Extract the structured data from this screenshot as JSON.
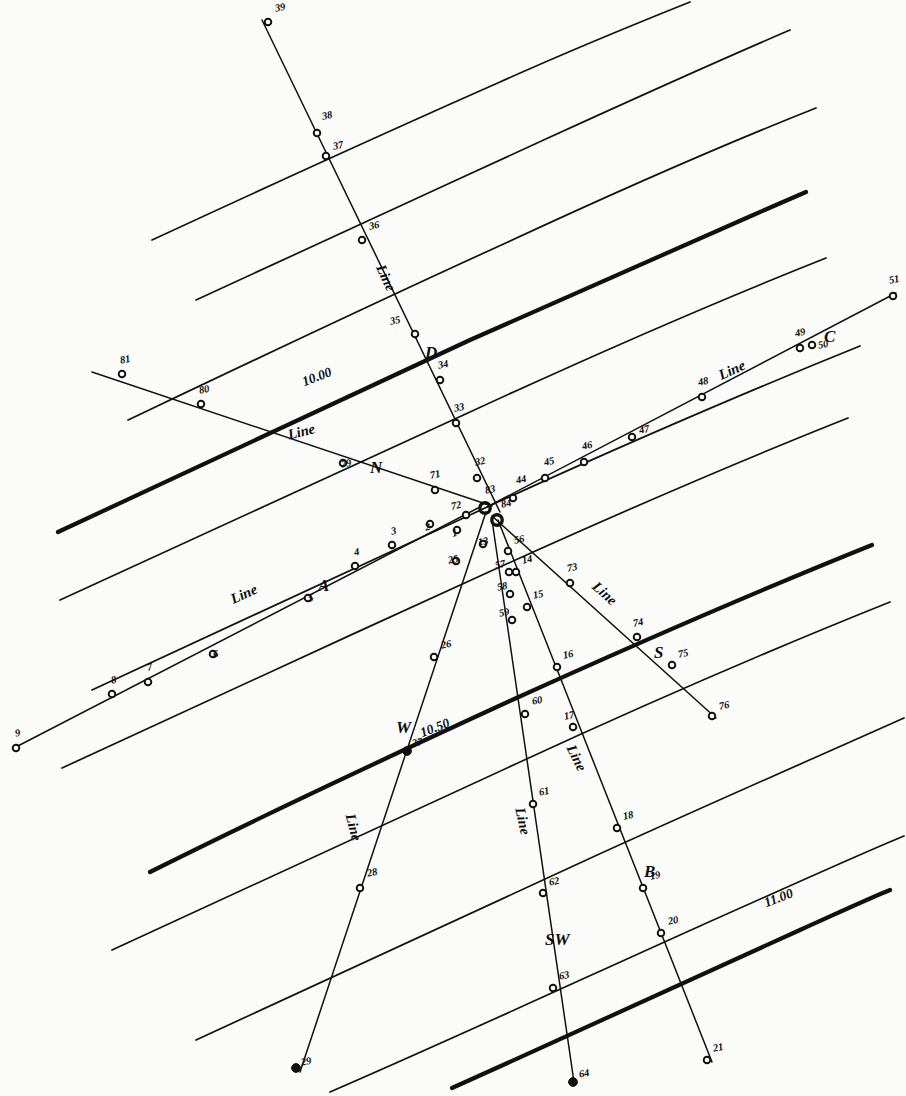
{
  "figure": {
    "kind": "survey-plan",
    "ink": "#101010",
    "paper": "#fbfbf9"
  },
  "chart_data": {
    "type": "scatter",
    "title": "",
    "xlabel": "",
    "ylabel": "",
    "grid": false,
    "legend": null,
    "contours": [
      {
        "label": "10.00",
        "label_x": 300,
        "label_y": 375,
        "label_rot": -21,
        "weight": "heavy",
        "path": "M 58,532 C 190,470 330,405 470,340 C 600,282 700,238 806,192"
      },
      {
        "label": "10.50",
        "label_x": 418,
        "label_y": 726,
        "label_rot": -21,
        "weight": "heavy",
        "path": "M 150,872 C 270,812 390,756 512,700 C 640,642 755,592 872,545"
      },
      {
        "label": "11.00",
        "label_x": 762,
        "label_y": 896,
        "label_rot": -21,
        "weight": "heavy",
        "path": "M 452,1088 C 570,1035 690,980 800,930 C 840,912 870,898 890,890"
      },
      {
        "label": "",
        "weight": "light",
        "path": "M 152,240 C 260,190 380,135 500,82 C 580,46 640,22 690,2"
      },
      {
        "label": "",
        "weight": "light",
        "path": "M 196,300 C 310,248 430,192 548,138 C 640,96 720,60 790,30"
      },
      {
        "label": "",
        "weight": "light",
        "path": "M 128,420 C 250,362 380,300 508,242 C 620,190 720,146 816,108"
      },
      {
        "label": "",
        "weight": "light",
        "path": "M 60,600 C 190,540 330,476 470,412 C 600,352 710,304 826,258"
      },
      {
        "label": "",
        "weight": "light",
        "path": "M 92,690 C 220,630 360,566 498,502 C 630,442 746,392 860,346"
      },
      {
        "label": "",
        "weight": "light",
        "path": "M 62,768 C 195,706 340,640 480,576 C 612,516 732,464 848,418"
      },
      {
        "label": "",
        "weight": "light",
        "path": "M 112,950 C 240,890 380,826 520,762 C 650,702 770,650 890,602"
      },
      {
        "label": "",
        "weight": "light",
        "path": "M 196,1040 C 320,982 450,922 582,862 C 700,808 810,760 904,718"
      },
      {
        "label": "",
        "weight": "light",
        "path": "M 330,1092 C 450,1040 580,980 700,926 C 790,886 860,854 904,836"
      }
    ],
    "lines": [
      {
        "name": "A",
        "label": "Line",
        "label_x": 228,
        "label_y": 592,
        "label_rot": -24,
        "name_x": 318,
        "name_y": 576,
        "path": "M 14,748 L 478,508",
        "weight": "light",
        "points": [
          "9",
          "8",
          "7",
          "6",
          "5",
          "4",
          "3",
          "2",
          "1",
          "72"
        ]
      },
      {
        "name": "N",
        "label": "Line",
        "label_x": 286,
        "label_y": 427,
        "label_rot": -14,
        "name_x": 370,
        "name_y": 458,
        "path": "M 92,372 L 492,506",
        "weight": "light",
        "points": [
          "81",
          "80",
          "79",
          "71"
        ]
      },
      {
        "name": "D",
        "label": "Line",
        "label_x": 388,
        "label_y": 262,
        "label_rot": 66,
        "name_x": 425,
        "name_y": 343,
        "path": "M 262,20 L 500,512",
        "weight": "light",
        "points": [
          "39",
          "38",
          "37",
          "36",
          "35",
          "34",
          "33",
          "32"
        ]
      },
      {
        "name": "C",
        "label": "Line",
        "label_x": 716,
        "label_y": 368,
        "label_rot": -24,
        "name_x": 824,
        "name_y": 327,
        "path": "M 487,507 L 896,293",
        "weight": "light",
        "points": [
          "44",
          "45",
          "46",
          "47",
          "48",
          "49",
          "50",
          "51"
        ]
      },
      {
        "name": "S",
        "label": "Line",
        "label_x": 600,
        "label_y": 578,
        "label_rot": 42,
        "name_x": 654,
        "name_y": 643,
        "path": "M 492,516 L 716,718",
        "weight": "light",
        "points": [
          "73",
          "74",
          "75",
          "76"
        ]
      },
      {
        "name": "B",
        "label": "Line",
        "label_x": 578,
        "label_y": 742,
        "label_rot": 64,
        "name_x": 644,
        "name_y": 862,
        "path": "M 498,520 L 712,1062",
        "weight": "light",
        "points": [
          "56",
          "14",
          "15",
          "16",
          "17",
          "18",
          "19",
          "20",
          "21"
        ]
      },
      {
        "name": "SW",
        "label": "Line",
        "label_x": 528,
        "label_y": 806,
        "label_rot": 78,
        "name_x": 545,
        "name_y": 930,
        "path": "M 492,520 L 574,1082",
        "weight": "light",
        "points": [
          "13",
          "57",
          "58",
          "59",
          "60",
          "61",
          "62",
          "63",
          "64"
        ]
      },
      {
        "name": "W",
        "label": "Line",
        "label_x": 358,
        "label_y": 812,
        "label_rot": 75,
        "name_x": 396,
        "name_y": 718,
        "path": "M 486,512 L 300,1072",
        "weight": "light",
        "points": [
          "25",
          "26",
          "27",
          "28",
          "29"
        ]
      }
    ],
    "stations": [
      {
        "id": "1",
        "x": 457,
        "y": 530,
        "lx": 451,
        "ly": 539,
        "marker": "open"
      },
      {
        "id": "2",
        "x": 430,
        "y": 524,
        "lx": 424,
        "ly": 533,
        "marker": "open"
      },
      {
        "id": "3",
        "x": 392,
        "y": 545,
        "lx": 390,
        "ly": 537,
        "marker": "open"
      },
      {
        "id": "4",
        "x": 355,
        "y": 566,
        "lx": 353,
        "ly": 558,
        "marker": "open"
      },
      {
        "id": "5",
        "x": 308,
        "y": 598,
        "lx": 307,
        "ly": 604,
        "marker": "open"
      },
      {
        "id": "6",
        "x": 213,
        "y": 654,
        "lx": 212,
        "ly": 660,
        "marker": "open"
      },
      {
        "id": "7",
        "x": 148,
        "y": 682,
        "lx": 146,
        "ly": 673,
        "marker": "open"
      },
      {
        "id": "8",
        "x": 112,
        "y": 694,
        "lx": 110,
        "ly": 686,
        "marker": "open"
      },
      {
        "id": "9",
        "x": 16,
        "y": 748,
        "lx": 14,
        "ly": 739,
        "marker": "open"
      },
      {
        "id": "13",
        "x": 483,
        "y": 544,
        "lx": 477,
        "ly": 548,
        "marker": "open"
      },
      {
        "id": "14",
        "x": 516,
        "y": 572,
        "lx": 521,
        "ly": 566,
        "marker": "open"
      },
      {
        "id": "15",
        "x": 527,
        "y": 607,
        "lx": 532,
        "ly": 601,
        "marker": "open"
      },
      {
        "id": "16",
        "x": 557,
        "y": 667,
        "lx": 562,
        "ly": 661,
        "marker": "open"
      },
      {
        "id": "17",
        "x": 573,
        "y": 727,
        "lx": 563,
        "ly": 722,
        "marker": "open"
      },
      {
        "id": "18",
        "x": 617,
        "y": 828,
        "lx": 622,
        "ly": 822,
        "marker": "open"
      },
      {
        "id": "19",
        "x": 643,
        "y": 888,
        "lx": 649,
        "ly": 882,
        "marker": "open"
      },
      {
        "id": "20",
        "x": 661,
        "y": 933,
        "lx": 667,
        "ly": 927,
        "marker": "open"
      },
      {
        "id": "21",
        "x": 707,
        "y": 1060,
        "lx": 712,
        "ly": 1054,
        "marker": "open"
      },
      {
        "id": "25",
        "x": 456,
        "y": 561,
        "lx": 447,
        "ly": 566,
        "marker": "open"
      },
      {
        "id": "26",
        "x": 434,
        "y": 657,
        "lx": 440,
        "ly": 651,
        "marker": "open"
      },
      {
        "id": "27",
        "x": 407,
        "y": 751,
        "lx": 411,
        "ly": 749,
        "marker": "solid"
      },
      {
        "id": "28",
        "x": 360,
        "y": 888,
        "lx": 366,
        "ly": 879,
        "marker": "open"
      },
      {
        "id": "29",
        "x": 296,
        "y": 1068,
        "lx": 300,
        "ly": 1068,
        "marker": "solid"
      },
      {
        "id": "32",
        "x": 477,
        "y": 478,
        "lx": 474,
        "ly": 468,
        "marker": "open"
      },
      {
        "id": "33",
        "x": 456,
        "y": 423,
        "lx": 453,
        "ly": 414,
        "marker": "open"
      },
      {
        "id": "34",
        "x": 440,
        "y": 380,
        "lx": 437,
        "ly": 371,
        "marker": "open"
      },
      {
        "id": "35",
        "x": 415,
        "y": 334,
        "lx": 389,
        "ly": 327,
        "marker": "open"
      },
      {
        "id": "36",
        "x": 362,
        "y": 240,
        "lx": 368,
        "ly": 232,
        "marker": "open"
      },
      {
        "id": "37",
        "x": 326,
        "y": 156,
        "lx": 332,
        "ly": 152,
        "marker": "open"
      },
      {
        "id": "38",
        "x": 317,
        "y": 133,
        "lx": 321,
        "ly": 122,
        "marker": "open"
      },
      {
        "id": "39",
        "x": 268,
        "y": 22,
        "lx": 274,
        "ly": 14,
        "marker": "open"
      },
      {
        "id": "44",
        "x": 513,
        "y": 498,
        "lx": 515,
        "ly": 486,
        "marker": "open"
      },
      {
        "id": "45",
        "x": 545,
        "y": 478,
        "lx": 543,
        "ly": 468,
        "marker": "open"
      },
      {
        "id": "46",
        "x": 584,
        "y": 462,
        "lx": 581,
        "ly": 452,
        "marker": "open"
      },
      {
        "id": "47",
        "x": 632,
        "y": 437,
        "lx": 638,
        "ly": 436,
        "marker": "open"
      },
      {
        "id": "48",
        "x": 702,
        "y": 397,
        "lx": 697,
        "ly": 388,
        "marker": "open"
      },
      {
        "id": "49",
        "x": 800,
        "y": 348,
        "lx": 794,
        "ly": 339,
        "marker": "open"
      },
      {
        "id": "50",
        "x": 812,
        "y": 345,
        "lx": 817,
        "ly": 351,
        "marker": "open"
      },
      {
        "id": "51",
        "x": 893,
        "y": 296,
        "lx": 888,
        "ly": 286,
        "marker": "open"
      },
      {
        "id": "56",
        "x": 508,
        "y": 551,
        "lx": 513,
        "ly": 546,
        "marker": "open"
      },
      {
        "id": "57",
        "x": 509,
        "y": 572,
        "lx": 494,
        "ly": 571,
        "marker": "open"
      },
      {
        "id": "58",
        "x": 510,
        "y": 594,
        "lx": 496,
        "ly": 593,
        "marker": "open"
      },
      {
        "id": "59",
        "x": 512,
        "y": 620,
        "lx": 498,
        "ly": 619,
        "marker": "open"
      },
      {
        "id": "60",
        "x": 525,
        "y": 714,
        "lx": 531,
        "ly": 707,
        "marker": "open"
      },
      {
        "id": "61",
        "x": 533,
        "y": 804,
        "lx": 538,
        "ly": 798,
        "marker": "open"
      },
      {
        "id": "62",
        "x": 543,
        "y": 893,
        "lx": 548,
        "ly": 888,
        "marker": "open"
      },
      {
        "id": "63",
        "x": 553,
        "y": 988,
        "lx": 558,
        "ly": 982,
        "marker": "open"
      },
      {
        "id": "64",
        "x": 573,
        "y": 1082,
        "lx": 578,
        "ly": 1080,
        "marker": "solid"
      },
      {
        "id": "71",
        "x": 435,
        "y": 490,
        "lx": 429,
        "ly": 481,
        "marker": "open"
      },
      {
        "id": "72",
        "x": 466,
        "y": 515,
        "lx": 450,
        "ly": 512,
        "marker": "open"
      },
      {
        "id": "73",
        "x": 570,
        "y": 583,
        "lx": 566,
        "ly": 574,
        "marker": "open"
      },
      {
        "id": "74",
        "x": 637,
        "y": 637,
        "lx": 632,
        "ly": 629,
        "marker": "open"
      },
      {
        "id": "75",
        "x": 672,
        "y": 665,
        "lx": 677,
        "ly": 660,
        "marker": "open"
      },
      {
        "id": "76",
        "x": 712,
        "y": 716,
        "lx": 718,
        "ly": 712,
        "marker": "open"
      },
      {
        "id": "79",
        "x": 343,
        "y": 463,
        "lx": 340,
        "ly": 470,
        "marker": "open"
      },
      {
        "id": "80",
        "x": 201,
        "y": 404,
        "lx": 198,
        "ly": 396,
        "marker": "open"
      },
      {
        "id": "81",
        "x": 122,
        "y": 374,
        "lx": 119,
        "ly": 366,
        "marker": "open"
      },
      {
        "id": "83",
        "x": 485,
        "y": 508,
        "lx": 484,
        "ly": 496,
        "marker": "hub"
      },
      {
        "id": "84",
        "x": 497,
        "y": 520,
        "lx": 500,
        "ly": 510,
        "marker": "hub"
      }
    ]
  }
}
